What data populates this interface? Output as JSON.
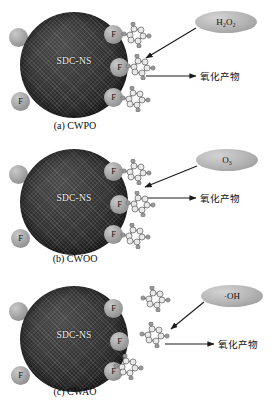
{
  "figure": {
    "background": "#ffffff",
    "particle_color": "#2b2b2b",
    "site_color": "#a8a8a8",
    "bubble_color": "#b6b6b6"
  },
  "panels": [
    {
      "id": "a",
      "caption": "(a) CWPO",
      "particle_label": "SDC-NS",
      "reagent": "H₂O₂",
      "reagent_name": "hydrogen-peroxide",
      "product": "氧化产物",
      "sites": [
        {
          "label": "F",
          "name": "fluorine-site-right-top"
        },
        {
          "label": "F",
          "name": "fluorine-site-right-middle"
        },
        {
          "label": "F",
          "name": "fluorine-site-right-bottom"
        },
        {
          "label": "",
          "name": "surface-site-left-top"
        },
        {
          "label": "F",
          "name": "fluorine-site-left-bottom"
        }
      ],
      "molecules_attached": true,
      "molecule_count": 3
    },
    {
      "id": "b",
      "caption": "(b) CWOO",
      "particle_label": "SDC-NS",
      "reagent": "O₃",
      "reagent_name": "ozone",
      "product": "氧化产物",
      "sites": [
        {
          "label": "F",
          "name": "fluorine-site-right-top"
        },
        {
          "label": "F",
          "name": "fluorine-site-right-middle"
        },
        {
          "label": "F",
          "name": "fluorine-site-right-bottom"
        },
        {
          "label": "",
          "name": "surface-site-left-top"
        },
        {
          "label": "F",
          "name": "fluorine-site-left-bottom"
        }
      ],
      "molecules_attached": true,
      "molecule_count": 3
    },
    {
      "id": "c",
      "caption": "(c) CWAO",
      "particle_label": "SDC-NS",
      "reagent": "·OH",
      "reagent_name": "hydroxyl-radical",
      "product": "氧化产物",
      "sites": [
        {
          "label": "F",
          "name": "fluorine-site-right-top"
        },
        {
          "label": "F",
          "name": "fluorine-site-right-middle"
        },
        {
          "label": "F",
          "name": "fluorine-site-right-bottom"
        },
        {
          "label": "",
          "name": "surface-site-left-top"
        },
        {
          "label": "F",
          "name": "fluorine-site-left-bottom"
        }
      ],
      "molecules_attached": false,
      "molecule_count": 3
    }
  ]
}
